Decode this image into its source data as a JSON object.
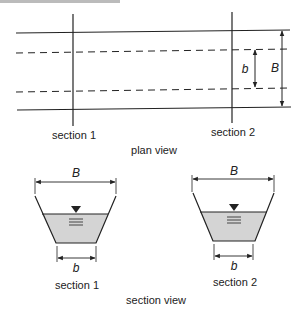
{
  "header_fragment": "Figure 3.5 Channel Transition",
  "plan_view": {
    "title": "plan view",
    "section_labels": [
      "section 1",
      "section 2"
    ],
    "dimension_labels": {
      "inner_width": "b",
      "outer_width": "B"
    }
  },
  "section_view": {
    "title": "section view",
    "sections": [
      {
        "label": "section 1",
        "top_width": "B",
        "bottom_width": "b"
      },
      {
        "label": "section 2",
        "top_width": "B",
        "bottom_width": "b"
      }
    ]
  },
  "colors": {
    "line": "#222222",
    "water": "#d4d4d4"
  }
}
